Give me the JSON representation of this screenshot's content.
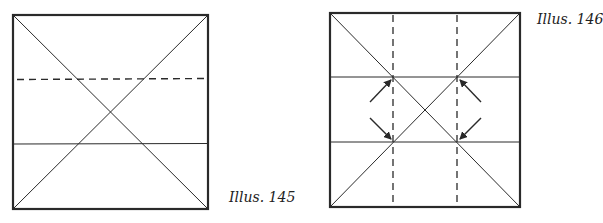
{
  "figures": [
    {
      "label": "Illus. 145",
      "square": {
        "x": 13,
        "y": 15,
        "size": 195
      },
      "diagonals": true,
      "dashed_horizontal_y": 79,
      "solid_horizontal_y": 144
    },
    {
      "label": "Illus. 146",
      "square": {
        "x": 330,
        "y": 13,
        "size": 192
      },
      "diagonals": true,
      "dashed_vertical_x": [
        393,
        457
      ],
      "solid_horizontal_y": [
        77,
        142
      ],
      "arrows": 4
    }
  ],
  "colors": {
    "line": "#2a2a2a",
    "background": "#ffffff"
  }
}
